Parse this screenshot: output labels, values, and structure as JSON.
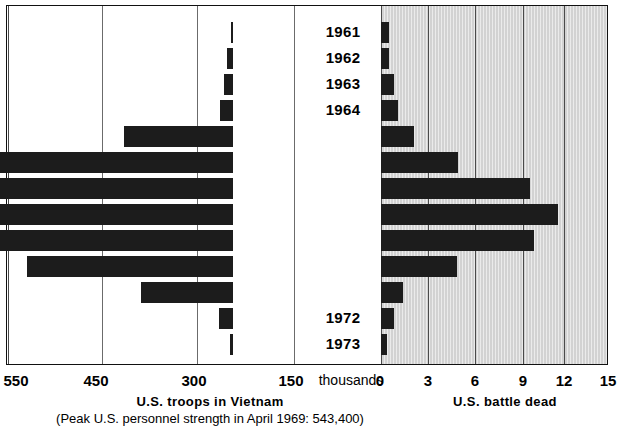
{
  "chart_data": {
    "type": "bar",
    "orientation": "horizontal",
    "style": "bidirectional-pyramid",
    "title": "",
    "categories": [
      "1961",
      "1962",
      "1963",
      "1964",
      "1965",
      "1966",
      "1967",
      "1968",
      "1969",
      "1970",
      "1971",
      "1972",
      "1973"
    ],
    "series": [
      {
        "name": "U.S. troops in Vietnam",
        "side": "left",
        "unit": "thousands",
        "axis_label": "U.S. troops in Vietnam",
        "values": [
          3,
          11,
          16,
          23,
          184,
          385,
          486,
          536,
          475,
          335,
          157,
          24,
          5
        ]
      },
      {
        "name": "U.S. battle dead",
        "side": "right",
        "unit": "thousands",
        "axis_label": "U.S. battle dead",
        "values": [
          0.5,
          0.5,
          0.8,
          1.1,
          2.1,
          4.9,
          9.4,
          11.2,
          9.7,
          4.8,
          1.4,
          0.8,
          0.4
        ]
      }
    ],
    "left_axis": {
      "label": "U.S. troops in Vietnam",
      "unit": "thousands",
      "ticks": [
        550,
        450,
        300,
        150,
        0
      ],
      "tick_labels": [
        "550",
        "450",
        "300",
        "150",
        "0"
      ],
      "direction": "right-to-left",
      "nonuniform": true
    },
    "right_axis": {
      "label": "U.S. battle dead",
      "unit": "thousands",
      "ticks": [
        0,
        3,
        6,
        9,
        12,
        15
      ],
      "tick_labels": [
        "0",
        "3",
        "6",
        "9",
        "12",
        "15"
      ],
      "direction": "left-to-right"
    },
    "center_unit_label": "thousands",
    "annotations": [
      "(Peak U.S. personnel strength in April 1969: 543,400)"
    ],
    "grid": true,
    "legend": "none",
    "colors": {
      "bar": "#1c1c1c",
      "panel_shade": "#d2d2d2",
      "background": "#ffffff",
      "grid": "#4a4a4a"
    }
  },
  "axis": {
    "units_label": "thousands",
    "left_ticks": [
      "550",
      "450",
      "300",
      "150"
    ],
    "right_ticks": [
      "0",
      "3",
      "6",
      "9",
      "12",
      "15"
    ],
    "left_title": "U.S. troops in Vietnam",
    "left_subtitle": "(Peak U.S. personnel strength in April 1969: 543,400)",
    "right_title": "U.S.  battle  dead"
  },
  "years": [
    "1961",
    "1962",
    "1963",
    "1964",
    "1965",
    "1966",
    "1967",
    "1968",
    "1969",
    "1970",
    "1971",
    "1972",
    "1973"
  ]
}
